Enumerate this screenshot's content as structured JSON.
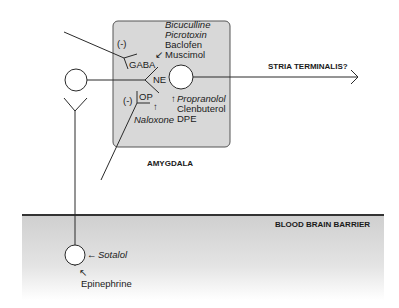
{
  "diagram": {
    "regions": {
      "amygdala": {
        "label": "AMYGDALA",
        "fill": "#d8d8d8"
      },
      "blood_brain_barrier": {
        "label": "BLOOD BRAIN BARRIER",
        "fill": "#d4d4d4"
      }
    },
    "projection": {
      "label": "STRIA TERMINALIS?"
    },
    "receptors": {
      "gaba": {
        "label": "GABA",
        "modulation": "(-)",
        "drugs": [
          "Bicuculline",
          "Picrotoxin",
          "Baclofen",
          "Muscimol"
        ],
        "drug_styles": [
          "italic",
          "italic",
          "normal",
          "normal"
        ]
      },
      "ne": {
        "label": "NE",
        "drugs": [
          "Propranolol",
          "Clenbuterol",
          "DPE"
        ],
        "drug_styles": [
          "italic",
          "normal",
          "normal"
        ]
      },
      "op": {
        "label": "OP",
        "modulation": "(-)",
        "drugs": [
          "Naloxone"
        ],
        "drug_styles": [
          "italic"
        ]
      },
      "peripheral": {
        "antagonist": "Sotalol",
        "agonist": "Epinephrine"
      }
    },
    "arrows": {
      "down_left": "↙",
      "up": "↑",
      "left": "←",
      "up_left": "↖"
    }
  }
}
